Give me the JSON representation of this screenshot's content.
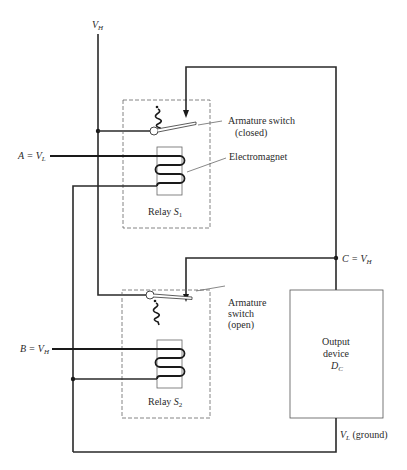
{
  "diagram": {
    "type": "relay-logic-circuit",
    "labels": {
      "vh_top": {
        "main": "V",
        "sub": "H"
      },
      "input_a": {
        "prefix": "A = ",
        "main": "V",
        "sub": "L"
      },
      "input_b": {
        "prefix": "B = ",
        "main": "V",
        "sub": "H"
      },
      "output_c": {
        "prefix": "C = ",
        "main": "V",
        "sub": "H"
      },
      "ground": {
        "main": "V",
        "sub": "L",
        "suffix": " (ground)"
      }
    },
    "relay1": {
      "name_prefix": "Relay ",
      "name_main": "S",
      "name_sub": "1",
      "switch_label_line1": "Armature switch",
      "switch_label_line2": "(closed)",
      "switch_state": "closed",
      "coil_label": "Electromagnet"
    },
    "relay2": {
      "name_prefix": "Relay ",
      "name_main": "S",
      "name_sub": "2",
      "switch_label_line1": "Armature",
      "switch_label_line2": "switch",
      "switch_label_line3": "(open)",
      "switch_state": "open"
    },
    "output_device": {
      "line1": "Output",
      "line2": "device",
      "name_main": "D",
      "name_sub": "C"
    },
    "colors": {
      "wire": "#2a2a2a",
      "dashed_border": "#666666",
      "background": "#ffffff"
    }
  }
}
